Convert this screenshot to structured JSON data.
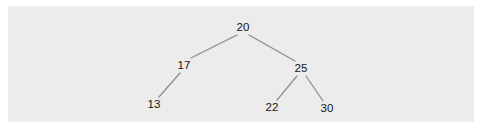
{
  "diagram": {
    "type": "binary-search-tree",
    "background_color": "#ececec",
    "edge_color": "#8e8e8e",
    "text_color": "#141414",
    "nodes": [
      {
        "id": "n20",
        "value": "20",
        "x": 243,
        "y": 28
      },
      {
        "id": "n17",
        "value": "17",
        "x": 184,
        "y": 66
      },
      {
        "id": "n25",
        "value": "25",
        "x": 301,
        "y": 69
      },
      {
        "id": "n13",
        "value": "13",
        "x": 154,
        "y": 105
      },
      {
        "id": "n22",
        "value": "22",
        "x": 272,
        "y": 108
      },
      {
        "id": "n30",
        "value": "30",
        "x": 327,
        "y": 109
      }
    ],
    "edges": [
      {
        "from": "20",
        "to": "17",
        "x1": 237,
        "y1": 35,
        "x2": 191,
        "y2": 58
      },
      {
        "from": "20",
        "to": "25",
        "x1": 249,
        "y1": 35,
        "x2": 295,
        "y2": 61
      },
      {
        "from": "17",
        "to": "13",
        "x1": 180,
        "y1": 73,
        "x2": 159,
        "y2": 97
      },
      {
        "from": "25",
        "to": "22",
        "x1": 297,
        "y1": 76,
        "x2": 277,
        "y2": 100
      },
      {
        "from": "25",
        "to": "30",
        "x1": 306,
        "y1": 76,
        "x2": 323,
        "y2": 101
      }
    ]
  }
}
